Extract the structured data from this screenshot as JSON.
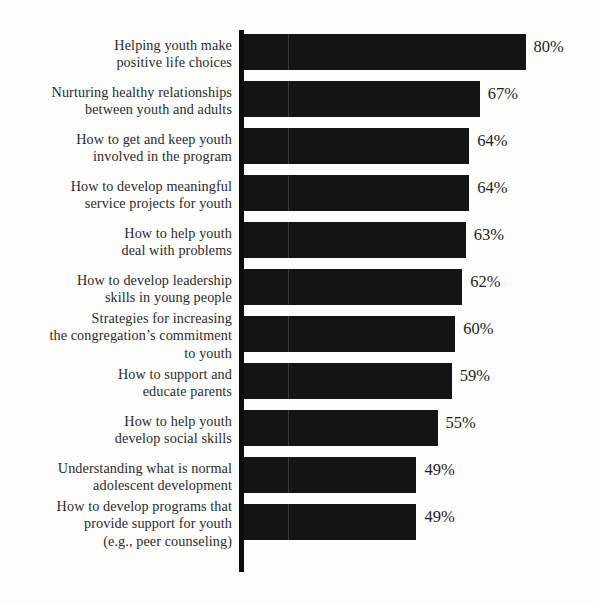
{
  "chart_data": {
    "type": "bar",
    "orientation": "horizontal",
    "title": "",
    "subtitle": "",
    "xlabel": "",
    "ylabel": "",
    "xlim": [
      0,
      100
    ],
    "grid": false,
    "legend": null,
    "value_suffix": "%",
    "categories": [
      "Helping youth make positive life choices",
      "Nurturing healthy relationships between youth and adults",
      "How to get and keep youth involved in the program",
      "How to develop meaningful service projects for youth",
      "How to help youth deal with problems",
      "How to develop leadership skills in young people",
      "Strategies for increasing the congregation's commitment to youth",
      "How to support and educate parents",
      "How to help youth develop social skills",
      "Understanding what is normal adolescent development",
      "How to develop programs that provide support for youth (e.g., peer counseling)"
    ],
    "values": [
      80,
      67,
      64,
      64,
      63,
      62,
      60,
      59,
      55,
      49,
      49
    ],
    "value_labels": [
      "80%",
      "67%",
      "64%",
      "64%",
      "63%",
      "62%",
      "60%",
      "59%",
      "55%",
      "49%",
      "49%"
    ]
  },
  "rows": [
    {
      "label_lines": [
        "Helping youth make",
        "positive life choices"
      ],
      "value": 80,
      "value_label": "80%"
    },
    {
      "label_lines": [
        "Nurturing healthy relationships",
        "between youth and adults"
      ],
      "value": 67,
      "value_label": "67%"
    },
    {
      "label_lines": [
        "How to get and keep youth",
        "involved in the program"
      ],
      "value": 64,
      "value_label": "64%"
    },
    {
      "label_lines": [
        "How to develop meaningful",
        "service projects for youth"
      ],
      "value": 64,
      "value_label": "64%"
    },
    {
      "label_lines": [
        "How to help youth",
        "deal with problems"
      ],
      "value": 63,
      "value_label": "63%"
    },
    {
      "label_lines": [
        "How to develop leadership",
        "skills in young people"
      ],
      "value": 62,
      "value_label": "62%"
    },
    {
      "label_lines": [
        "Strategies for increasing",
        "the congregation’s commitment",
        "to youth"
      ],
      "value": 60,
      "value_label": "60%"
    },
    {
      "label_lines": [
        "How to support and",
        "educate parents"
      ],
      "value": 59,
      "value_label": "59%"
    },
    {
      "label_lines": [
        "How to help youth",
        "develop social skills"
      ],
      "value": 55,
      "value_label": "55%"
    },
    {
      "label_lines": [
        "Understanding what is normal",
        "adolescent development"
      ],
      "value": 49,
      "value_label": "49%"
    },
    {
      "label_lines": [
        "How to develop programs that",
        "provide support for youth",
        "(e.g., peer counseling)"
      ],
      "value": 49,
      "value_label": "49%"
    }
  ],
  "style": {
    "bar_color": "#141414",
    "text_color": "#2b2b2b",
    "axis_color": "#0d0d0d",
    "background": "#fdfdfc"
  },
  "geometry": {
    "axis_x": 244,
    "first_row_top": 30,
    "row_pitch": 47,
    "bar_height": 36,
    "px_per_percent": 3.52,
    "label_right_edge": 232,
    "value_gap": 8
  }
}
